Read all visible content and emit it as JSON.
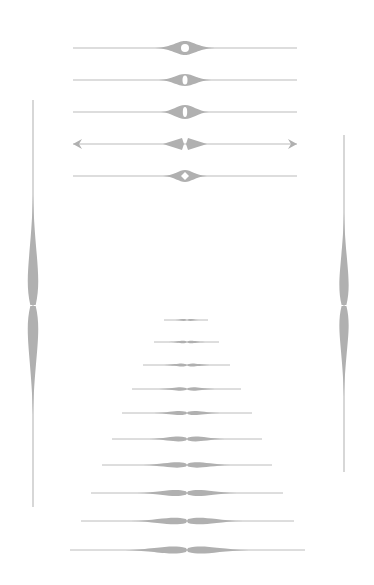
{
  "canvas": {
    "width": 374,
    "height": 585,
    "background": "#ffffff"
  },
  "colors": {
    "line": "#bcbcbc",
    "fill": "#b0b0b0",
    "hole": "#ffffff"
  },
  "horizontal_dividers": [
    {
      "id": "divider-circle",
      "y": 48,
      "x1": 73,
      "x2": 297,
      "cx": 185,
      "style": "circle-center",
      "bulge_half": 30,
      "bulge_h": 7
    },
    {
      "id": "divider-oval",
      "y": 80,
      "x1": 73,
      "x2": 297,
      "cx": 185,
      "style": "oval-center",
      "bulge_half": 26,
      "bulge_h": 6
    },
    {
      "id": "divider-oval-wide",
      "y": 112,
      "x1": 73,
      "x2": 297,
      "cx": 185,
      "style": "oval-wide",
      "bulge_half": 24,
      "bulge_h": 7
    },
    {
      "id": "divider-arrows",
      "y": 144,
      "x1": 73,
      "x2": 297,
      "cx": 185,
      "style": "double-diamond-arrows",
      "bulge_half": 22,
      "bulge_h": 6
    },
    {
      "id": "divider-diamond-hole",
      "y": 176,
      "x1": 73,
      "x2": 297,
      "cx": 185,
      "style": "diamond-hole",
      "bulge_half": 22,
      "bulge_h": 6
    }
  ],
  "vertical_dividers": [
    {
      "id": "vertical-left",
      "x": 33,
      "y1": 100,
      "y2": 507,
      "cy": 305,
      "bulge_half": 110,
      "bulge_w": 9
    },
    {
      "id": "vertical-right",
      "x": 344,
      "y1": 135,
      "y2": 472,
      "cy": 305,
      "bulge_half": 92,
      "bulge_w": 8
    }
  ],
  "stacked_dividers": [
    {
      "y": 320,
      "x1": 164,
      "x2": 208,
      "bulge_half": 12,
      "bulge_h": 1.5
    },
    {
      "y": 342,
      "x1": 154,
      "x2": 219,
      "bulge_half": 18,
      "bulge_h": 2
    },
    {
      "y": 365,
      "x1": 143,
      "x2": 230,
      "bulge_half": 23,
      "bulge_h": 2.5
    },
    {
      "y": 389,
      "x1": 132,
      "x2": 241,
      "bulge_half": 28,
      "bulge_h": 3
    },
    {
      "y": 413,
      "x1": 122,
      "x2": 252,
      "bulge_half": 33,
      "bulge_h": 3.5
    },
    {
      "y": 439,
      "x1": 112,
      "x2": 262,
      "bulge_half": 38,
      "bulge_h": 4
    },
    {
      "y": 465,
      "x1": 102,
      "x2": 272,
      "bulge_half": 44,
      "bulge_h": 4.5
    },
    {
      "y": 493,
      "x1": 91,
      "x2": 283,
      "bulge_half": 50,
      "bulge_h": 5
    },
    {
      "y": 521,
      "x1": 81,
      "x2": 294,
      "bulge_half": 56,
      "bulge_h": 5.5
    },
    {
      "y": 550,
      "x1": 70,
      "x2": 305,
      "bulge_half": 62,
      "bulge_h": 6
    }
  ],
  "stacked_center_x": 187
}
